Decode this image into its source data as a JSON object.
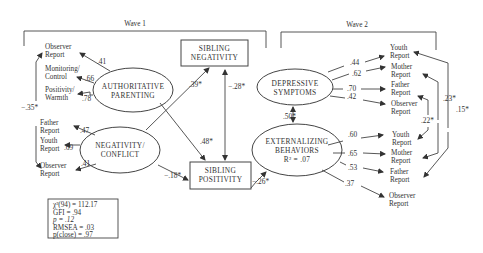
{
  "waves": [
    {
      "label": "Wave 1"
    },
    {
      "label": "Wave 2"
    }
  ],
  "latent_constructs": {
    "authoritative_parenting": {
      "line1": "AUTHORITATIVE",
      "line2": "PARENTING"
    },
    "negativity_conflict": {
      "line1": "NEGATIVITY/",
      "line2": "CONFLICT"
    },
    "depressive_symptoms": {
      "line1": "DEPRESSIVE",
      "line2": "SYMPTOMS"
    },
    "externalizing_behaviors": {
      "line1": "EXTERNALIZING",
      "line2": "BEHAVIORS",
      "line3": "R² = .07"
    }
  },
  "observed_boxes": {
    "sibling_negativity": {
      "line1": "SIBLING",
      "line2": "NEGATIVITY"
    },
    "sibling_positivity": {
      "line1": "SIBLING",
      "line2": "POSITIVITY"
    }
  },
  "indicators": {
    "authoritative_parenting": [
      {
        "line1": "Observer",
        "line2": "Report",
        "loading": ".41"
      },
      {
        "line1": "Monitoring/",
        "line2": "Control",
        "loading": ".66"
      },
      {
        "line1": "Positivity/",
        "line2": "Warmth",
        "loading": ".78"
      }
    ],
    "negativity_conflict": [
      {
        "line1": "Father",
        "line2": "Report",
        "loading": ".47"
      },
      {
        "line1": "Youth",
        "line2": "Report",
        "loading": ".69"
      },
      {
        "line1": "Observer",
        "line2": "Report",
        "loading": ".41"
      }
    ],
    "depressive_symptoms": [
      {
        "line1": "Youth",
        "line2": "Report",
        "loading": ".44"
      },
      {
        "line1": "Mother",
        "line2": "Report",
        "loading": ".62"
      },
      {
        "line1": "Father",
        "line2": "Report",
        "loading": ".70"
      },
      {
        "line1": "Observer",
        "line2": "Report",
        "loading": ".42"
      }
    ],
    "externalizing_behaviors": [
      {
        "line1": "Youth",
        "line2": "Report",
        "loading": ".60"
      },
      {
        "line1": "Mother",
        "line2": "Report",
        "loading": ".65"
      },
      {
        "line1": "Father",
        "line2": "Report",
        "loading": ".53"
      },
      {
        "line1": "Observer",
        "line2": "Report",
        "loading": ".37"
      }
    ]
  },
  "paths": {
    "negativity_to_sibling_negativity": ".39*",
    "sibling_negativity_with_sibling_positivity": "−.28*",
    "authoritative_to_sibling_positivity": ".48*",
    "negativity_to_sibling_positivity": "−.18*",
    "sibling_positivity_to_externalizing": "−.26*",
    "depressive_with_externalizing": ".50*"
  },
  "correlated_errors": {
    "observer_reports_wave1": "−.35*",
    "youth_reports_wave2": ".23*",
    "mother_reports_wave2": ".15*",
    "father_reports_wave2": ".22*"
  },
  "fit_statistics": {
    "chi_square": "χ²(94) = 112.17",
    "gfi": "GFI = .94",
    "p": "p = .12",
    "rmsea": "RMSEA = .03",
    "p_close": "p(close) = .97"
  }
}
